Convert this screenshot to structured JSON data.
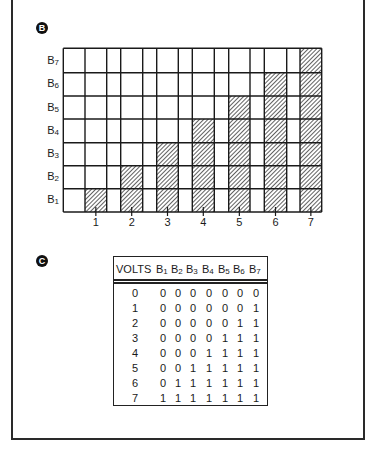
{
  "panel_b": {
    "label": "B",
    "y_labels": [
      {
        "base": "B",
        "sub": "7"
      },
      {
        "base": "B",
        "sub": "6"
      },
      {
        "base": "B",
        "sub": "5"
      },
      {
        "base": "B",
        "sub": "4"
      },
      {
        "base": "B",
        "sub": "3"
      },
      {
        "base": "B",
        "sub": "2"
      },
      {
        "base": "B",
        "sub": "1"
      }
    ],
    "x_labels": [
      "1",
      "2",
      "3",
      "4",
      "5",
      "6",
      "7"
    ]
  },
  "panel_c": {
    "label": "C",
    "header": {
      "volts": "VOLTS",
      "bits": [
        {
          "base": "B",
          "sub": "1"
        },
        {
          "base": "B",
          "sub": "2"
        },
        {
          "base": "B",
          "sub": "3"
        },
        {
          "base": "B",
          "sub": "4"
        },
        {
          "base": "B",
          "sub": "5"
        },
        {
          "base": "B",
          "sub": "6"
        },
        {
          "base": "B",
          "sub": "7"
        }
      ]
    },
    "rows": [
      {
        "volts": "0",
        "bits": [
          "0",
          "0",
          "0",
          "0",
          "0",
          "0",
          "0"
        ]
      },
      {
        "volts": "1",
        "bits": [
          "0",
          "0",
          "0",
          "0",
          "0",
          "0",
          "1"
        ]
      },
      {
        "volts": "2",
        "bits": [
          "0",
          "0",
          "0",
          "0",
          "0",
          "1",
          "1"
        ]
      },
      {
        "volts": "3",
        "bits": [
          "0",
          "0",
          "0",
          "0",
          "1",
          "1",
          "1"
        ]
      },
      {
        "volts": "4",
        "bits": [
          "0",
          "0",
          "0",
          "1",
          "1",
          "1",
          "1"
        ]
      },
      {
        "volts": "5",
        "bits": [
          "0",
          "0",
          "1",
          "1",
          "1",
          "1",
          "1"
        ]
      },
      {
        "volts": "6",
        "bits": [
          "0",
          "1",
          "1",
          "1",
          "1",
          "1",
          "1"
        ]
      },
      {
        "volts": "7",
        "bits": [
          "1",
          "1",
          "1",
          "1",
          "1",
          "1",
          "1"
        ]
      }
    ]
  },
  "chart_data": {
    "type": "heatmap",
    "title": "",
    "xlabel": "",
    "ylabel": "",
    "x": [
      "1",
      "2",
      "3",
      "4",
      "5",
      "6",
      "7"
    ],
    "y": [
      "B1",
      "B2",
      "B3",
      "B4",
      "B5",
      "B6",
      "B7"
    ],
    "shaded_counts_per_column": [
      1,
      2,
      3,
      4,
      5,
      6,
      7
    ],
    "grid": true,
    "legend": "none"
  }
}
